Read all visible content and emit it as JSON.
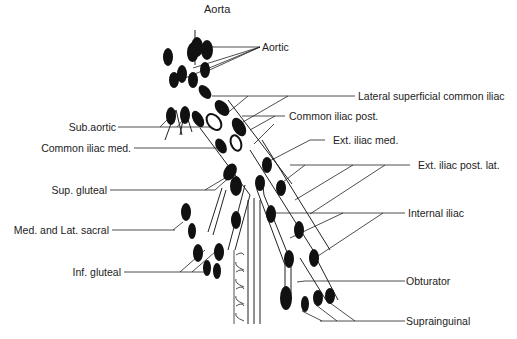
{
  "diagram": {
    "title": "Aorta",
    "labels_right": {
      "aortic": "Aortic",
      "lateral_superficial_common_iliac": "Lateral superficial common iliac",
      "common_iliac_post": "Common iliac post.",
      "ext_iliac_med": "Ext. iliac med.",
      "ext_iliac_post_lat": "Ext. iliac post. lat.",
      "internal_iliac": "Internal iliac",
      "obturator": "Obturator",
      "suprainguinal": "Suprainguinal"
    },
    "labels_left": {
      "sub_aortic": "Sub.aortic",
      "common_iliac_med": "Common iliac med.",
      "sup_gluteal": "Sup. gluteal",
      "med_and_lat_sacral": "Med. and Lat. sacral",
      "inf_gluteal": "Inf. gluteal"
    },
    "colors": {
      "ink": "#111111",
      "background": "#ffffff"
    }
  }
}
